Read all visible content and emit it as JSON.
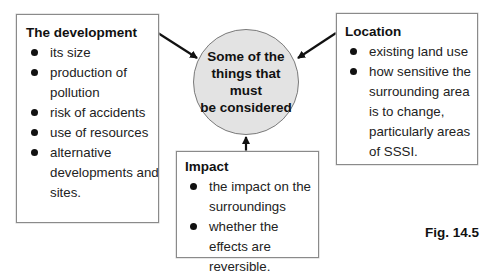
{
  "center": {
    "text": "Some of the\nthings that must\nbe considered",
    "fill": "#e3e3e3"
  },
  "boxes": {
    "development": {
      "title": "The development",
      "items": [
        "its size",
        "production of pollution",
        "risk of accidents",
        "use of resources",
        "alternative developments and sites."
      ]
    },
    "location": {
      "title": "Location",
      "items": [
        "existing land use",
        "how sensitive the surrounding area is to change, particularly areas of SSSI."
      ]
    },
    "impact": {
      "title": "Impact",
      "items": [
        "the impact on the surroundings",
        "whether the effects are reversible."
      ]
    }
  },
  "figure_label": "Fig. 14.5"
}
